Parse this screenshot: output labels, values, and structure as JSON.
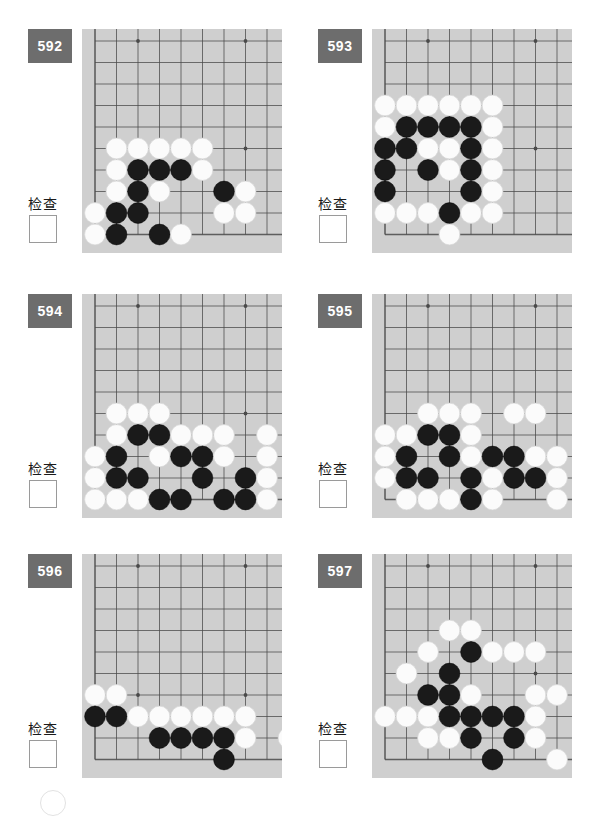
{
  "page": {
    "board_bg_color": "#cfcfcf",
    "badge_color": "#6d6d6d",
    "line_color": "#4a4a4a",
    "black_stone_color": "#1a1a1a",
    "white_stone_color": "#fbfbfb",
    "check_label": "检查",
    "columns": 9,
    "rows": 10
  },
  "problems": [
    {
      "number": "592",
      "check_label": "检查",
      "board": {
        "corner": "bottom-left",
        "cols": 9,
        "rows": 10,
        "star_points": [
          [
            3,
            1
          ],
          [
            8,
            1
          ],
          [
            8,
            6
          ]
        ],
        "stones": [
          {
            "c": 2,
            "r": 6,
            "color": "white"
          },
          {
            "c": 3,
            "r": 6,
            "color": "white"
          },
          {
            "c": 4,
            "r": 6,
            "color": "white"
          },
          {
            "c": 5,
            "r": 6,
            "color": "white"
          },
          {
            "c": 6,
            "r": 6,
            "color": "white"
          },
          {
            "c": 2,
            "r": 7,
            "color": "white"
          },
          {
            "c": 3,
            "r": 7,
            "color": "black"
          },
          {
            "c": 4,
            "r": 7,
            "color": "black"
          },
          {
            "c": 5,
            "r": 7,
            "color": "black"
          },
          {
            "c": 6,
            "r": 7,
            "color": "white"
          },
          {
            "c": 2,
            "r": 8,
            "color": "white"
          },
          {
            "c": 3,
            "r": 8,
            "color": "black"
          },
          {
            "c": 4,
            "r": 8,
            "color": "white"
          },
          {
            "c": 7,
            "r": 8,
            "color": "black"
          },
          {
            "c": 8,
            "r": 8,
            "color": "white"
          },
          {
            "c": 1,
            "r": 9,
            "color": "white"
          },
          {
            "c": 2,
            "r": 9,
            "color": "black"
          },
          {
            "c": 3,
            "r": 9,
            "color": "black"
          },
          {
            "c": 7,
            "r": 9,
            "color": "white"
          },
          {
            "c": 8,
            "r": 9,
            "color": "white"
          },
          {
            "c": 1,
            "r": 10,
            "color": "white"
          },
          {
            "c": 2,
            "r": 10,
            "color": "black"
          },
          {
            "c": 4,
            "r": 10,
            "color": "black"
          },
          {
            "c": 5,
            "r": 10,
            "color": "white"
          }
        ]
      }
    },
    {
      "number": "593",
      "check_label": "检查",
      "board": {
        "corner": "bottom-left",
        "cols": 9,
        "rows": 10,
        "star_points": [
          [
            3,
            1
          ],
          [
            8,
            1
          ],
          [
            8,
            6
          ]
        ],
        "stones": [
          {
            "c": 1,
            "r": 4,
            "color": "white"
          },
          {
            "c": 2,
            "r": 4,
            "color": "white"
          },
          {
            "c": 3,
            "r": 4,
            "color": "white"
          },
          {
            "c": 4,
            "r": 4,
            "color": "white"
          },
          {
            "c": 5,
            "r": 4,
            "color": "white"
          },
          {
            "c": 6,
            "r": 4,
            "color": "white"
          },
          {
            "c": 1,
            "r": 5,
            "color": "white"
          },
          {
            "c": 2,
            "r": 5,
            "color": "black"
          },
          {
            "c": 3,
            "r": 5,
            "color": "black"
          },
          {
            "c": 4,
            "r": 5,
            "color": "black"
          },
          {
            "c": 5,
            "r": 5,
            "color": "black"
          },
          {
            "c": 6,
            "r": 5,
            "color": "white"
          },
          {
            "c": 1,
            "r": 6,
            "color": "black"
          },
          {
            "c": 2,
            "r": 6,
            "color": "black"
          },
          {
            "c": 3,
            "r": 6,
            "color": "white"
          },
          {
            "c": 4,
            "r": 6,
            "color": "white"
          },
          {
            "c": 5,
            "r": 6,
            "color": "black"
          },
          {
            "c": 6,
            "r": 6,
            "color": "white"
          },
          {
            "c": 1,
            "r": 7,
            "color": "black"
          },
          {
            "c": 3,
            "r": 7,
            "color": "black"
          },
          {
            "c": 4,
            "r": 7,
            "color": "white"
          },
          {
            "c": 5,
            "r": 7,
            "color": "black"
          },
          {
            "c": 6,
            "r": 7,
            "color": "white"
          },
          {
            "c": 1,
            "r": 8,
            "color": "black"
          },
          {
            "c": 5,
            "r": 8,
            "color": "black"
          },
          {
            "c": 6,
            "r": 8,
            "color": "white"
          },
          {
            "c": 1,
            "r": 9,
            "color": "white"
          },
          {
            "c": 2,
            "r": 9,
            "color": "white"
          },
          {
            "c": 3,
            "r": 9,
            "color": "white"
          },
          {
            "c": 4,
            "r": 9,
            "color": "black"
          },
          {
            "c": 5,
            "r": 9,
            "color": "white"
          },
          {
            "c": 6,
            "r": 9,
            "color": "white"
          },
          {
            "c": 4,
            "r": 10,
            "color": "white"
          }
        ]
      }
    },
    {
      "number": "594",
      "check_label": "检查",
      "board": {
        "corner": "bottom-left",
        "cols": 9,
        "rows": 10,
        "star_points": [
          [
            3,
            1
          ],
          [
            8,
            1
          ],
          [
            8,
            6
          ]
        ],
        "stones": [
          {
            "c": 2,
            "r": 6,
            "color": "white"
          },
          {
            "c": 3,
            "r": 6,
            "color": "white"
          },
          {
            "c": 4,
            "r": 6,
            "color": "white"
          },
          {
            "c": 2,
            "r": 7,
            "color": "white"
          },
          {
            "c": 3,
            "r": 7,
            "color": "black"
          },
          {
            "c": 4,
            "r": 7,
            "color": "black"
          },
          {
            "c": 5,
            "r": 7,
            "color": "white"
          },
          {
            "c": 6,
            "r": 7,
            "color": "white"
          },
          {
            "c": 7,
            "r": 7,
            "color": "white"
          },
          {
            "c": 9,
            "r": 7,
            "color": "white"
          },
          {
            "c": 1,
            "r": 8,
            "color": "white"
          },
          {
            "c": 2,
            "r": 8,
            "color": "black"
          },
          {
            "c": 4,
            "r": 8,
            "color": "white"
          },
          {
            "c": 5,
            "r": 8,
            "color": "black"
          },
          {
            "c": 6,
            "r": 8,
            "color": "black"
          },
          {
            "c": 7,
            "r": 8,
            "color": "white"
          },
          {
            "c": 9,
            "r": 8,
            "color": "white"
          },
          {
            "c": 1,
            "r": 9,
            "color": "white"
          },
          {
            "c": 2,
            "r": 9,
            "color": "black"
          },
          {
            "c": 3,
            "r": 9,
            "color": "black"
          },
          {
            "c": 6,
            "r": 9,
            "color": "black"
          },
          {
            "c": 8,
            "r": 9,
            "color": "black"
          },
          {
            "c": 9,
            "r": 9,
            "color": "white"
          },
          {
            "c": 1,
            "r": 10,
            "color": "white"
          },
          {
            "c": 2,
            "r": 10,
            "color": "white"
          },
          {
            "c": 3,
            "r": 10,
            "color": "white"
          },
          {
            "c": 4,
            "r": 10,
            "color": "black"
          },
          {
            "c": 5,
            "r": 10,
            "color": "black"
          },
          {
            "c": 7,
            "r": 10,
            "color": "black"
          },
          {
            "c": 8,
            "r": 10,
            "color": "black"
          },
          {
            "c": 9,
            "r": 10,
            "color": "white"
          }
        ]
      }
    },
    {
      "number": "595",
      "check_label": "检查",
      "board": {
        "corner": "bottom-left",
        "cols": 9,
        "rows": 10,
        "star_points": [
          [
            3,
            1
          ],
          [
            8,
            1
          ],
          [
            8,
            6
          ]
        ],
        "stones": [
          {
            "c": 3,
            "r": 6,
            "color": "white"
          },
          {
            "c": 4,
            "r": 6,
            "color": "white"
          },
          {
            "c": 5,
            "r": 6,
            "color": "white"
          },
          {
            "c": 7,
            "r": 6,
            "color": "white"
          },
          {
            "c": 8,
            "r": 6,
            "color": "white"
          },
          {
            "c": 1,
            "r": 7,
            "color": "white"
          },
          {
            "c": 2,
            "r": 7,
            "color": "white"
          },
          {
            "c": 3,
            "r": 7,
            "color": "black"
          },
          {
            "c": 4,
            "r": 7,
            "color": "black"
          },
          {
            "c": 5,
            "r": 7,
            "color": "white"
          },
          {
            "c": 1,
            "r": 8,
            "color": "white"
          },
          {
            "c": 2,
            "r": 8,
            "color": "black"
          },
          {
            "c": 4,
            "r": 8,
            "color": "black"
          },
          {
            "c": 5,
            "r": 8,
            "color": "white"
          },
          {
            "c": 6,
            "r": 8,
            "color": "black"
          },
          {
            "c": 7,
            "r": 8,
            "color": "black"
          },
          {
            "c": 8,
            "r": 8,
            "color": "white"
          },
          {
            "c": 9,
            "r": 8,
            "color": "white"
          },
          {
            "c": 1,
            "r": 9,
            "color": "white"
          },
          {
            "c": 2,
            "r": 9,
            "color": "black"
          },
          {
            "c": 3,
            "r": 9,
            "color": "black"
          },
          {
            "c": 5,
            "r": 9,
            "color": "black"
          },
          {
            "c": 6,
            "r": 9,
            "color": "white"
          },
          {
            "c": 7,
            "r": 9,
            "color": "black"
          },
          {
            "c": 8,
            "r": 9,
            "color": "black"
          },
          {
            "c": 9,
            "r": 9,
            "color": "white"
          },
          {
            "c": 2,
            "r": 10,
            "color": "white"
          },
          {
            "c": 3,
            "r": 10,
            "color": "white"
          },
          {
            "c": 4,
            "r": 10,
            "color": "white"
          },
          {
            "c": 5,
            "r": 10,
            "color": "black"
          },
          {
            "c": 6,
            "r": 10,
            "color": "white"
          },
          {
            "c": 9,
            "r": 10,
            "color": "white"
          }
        ]
      }
    },
    {
      "number": "596",
      "check_label": "检查",
      "board": {
        "corner": "bottom-left",
        "cols": 9,
        "rows": 10,
        "star_points": [
          [
            3,
            1
          ],
          [
            8,
            1
          ],
          [
            3,
            7
          ],
          [
            8,
            7
          ]
        ],
        "stones": [
          {
            "c": 1,
            "r": 7,
            "color": "white"
          },
          {
            "c": 2,
            "r": 7,
            "color": "white"
          },
          {
            "c": 1,
            "r": 8,
            "color": "black"
          },
          {
            "c": 2,
            "r": 8,
            "color": "black"
          },
          {
            "c": 3,
            "r": 8,
            "color": "white"
          },
          {
            "c": 4,
            "r": 8,
            "color": "white"
          },
          {
            "c": 5,
            "r": 8,
            "color": "white"
          },
          {
            "c": 6,
            "r": 8,
            "color": "white"
          },
          {
            "c": 7,
            "r": 8,
            "color": "white"
          },
          {
            "c": 8,
            "r": 8,
            "color": "white"
          },
          {
            "c": 4,
            "r": 9,
            "color": "black"
          },
          {
            "c": 5,
            "r": 9,
            "color": "black"
          },
          {
            "c": 6,
            "r": 9,
            "color": "black"
          },
          {
            "c": 7,
            "r": 9,
            "color": "black"
          },
          {
            "c": 8,
            "r": 9,
            "color": "white"
          },
          {
            "c": 10,
            "r": 9,
            "color": "white"
          },
          {
            "c": 7,
            "r": 10,
            "color": "black"
          }
        ]
      }
    },
    {
      "number": "597",
      "check_label": "检查",
      "board": {
        "corner": "bottom-left",
        "cols": 9,
        "rows": 10,
        "star_points": [
          [
            3,
            1
          ],
          [
            8,
            1
          ],
          [
            8,
            6
          ]
        ],
        "stones": [
          {
            "c": 4,
            "r": 4,
            "color": "white"
          },
          {
            "c": 5,
            "r": 4,
            "color": "white"
          },
          {
            "c": 3,
            "r": 5,
            "color": "white"
          },
          {
            "c": 5,
            "r": 5,
            "color": "black"
          },
          {
            "c": 6,
            "r": 5,
            "color": "white"
          },
          {
            "c": 7,
            "r": 5,
            "color": "white"
          },
          {
            "c": 8,
            "r": 5,
            "color": "white"
          },
          {
            "c": 2,
            "r": 6,
            "color": "white"
          },
          {
            "c": 4,
            "r": 6,
            "color": "black"
          },
          {
            "c": 3,
            "r": 7,
            "color": "black"
          },
          {
            "c": 4,
            "r": 7,
            "color": "black"
          },
          {
            "c": 5,
            "r": 7,
            "color": "white"
          },
          {
            "c": 8,
            "r": 7,
            "color": "white"
          },
          {
            "c": 9,
            "r": 7,
            "color": "white"
          },
          {
            "c": 1,
            "r": 8,
            "color": "white"
          },
          {
            "c": 2,
            "r": 8,
            "color": "white"
          },
          {
            "c": 3,
            "r": 8,
            "color": "white"
          },
          {
            "c": 4,
            "r": 8,
            "color": "black"
          },
          {
            "c": 5,
            "r": 8,
            "color": "black"
          },
          {
            "c": 6,
            "r": 8,
            "color": "black"
          },
          {
            "c": 7,
            "r": 8,
            "color": "black"
          },
          {
            "c": 8,
            "r": 8,
            "color": "white"
          },
          {
            "c": 3,
            "r": 9,
            "color": "white"
          },
          {
            "c": 4,
            "r": 9,
            "color": "white"
          },
          {
            "c": 5,
            "r": 9,
            "color": "black"
          },
          {
            "c": 7,
            "r": 9,
            "color": "black"
          },
          {
            "c": 8,
            "r": 9,
            "color": "white"
          },
          {
            "c": 6,
            "r": 10,
            "color": "black"
          },
          {
            "c": 9,
            "r": 10,
            "color": "white"
          }
        ]
      }
    }
  ]
}
